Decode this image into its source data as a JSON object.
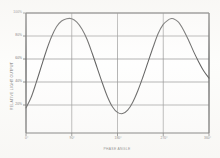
{
  "chart_data": {
    "type": "line",
    "title": "",
    "xlabel": "PHASE ANGLE",
    "ylabel": "RELATIVE LIGHT OUTPUT",
    "xlim": [
      0,
      360
    ],
    "ylim": [
      0,
      105
    ],
    "grid": true,
    "legend": "none",
    "x_tick_labels": [
      "0°",
      "90°",
      "180°",
      "270°",
      "360°"
    ],
    "x_tick_values": [
      0,
      90,
      180,
      270,
      360
    ],
    "y_tick_labels": [
      "20%",
      "40%",
      "60%",
      "80%",
      "100%"
    ],
    "y_tick_values": [
      20,
      40,
      60,
      80,
      100
    ],
    "series": [
      {
        "name": "relative light output",
        "x": [
          0,
          10,
          20,
          30,
          40,
          50,
          60,
          70,
          80,
          90,
          100,
          110,
          120,
          130,
          140,
          150,
          160,
          170,
          180,
          190,
          200,
          210,
          220,
          230,
          240,
          250,
          260,
          270,
          280,
          285,
          290,
          300,
          310,
          320,
          330,
          340,
          350,
          360
        ],
        "values": [
          22,
          31,
          44,
          58,
          72,
          84,
          93,
          98,
          100,
          100,
          97,
          91,
          82,
          70,
          57,
          44,
          32,
          23,
          18,
          17,
          20,
          27,
          37,
          49,
          62,
          75,
          87,
          95,
          99,
          100,
          100,
          97,
          90,
          81,
          71,
          62,
          54,
          48
        ]
      }
    ],
    "colors": {
      "curve": "#2b2b2b",
      "grid": "#6e6e6e",
      "axis": "#3a3a3a",
      "background": "#fdfdfb",
      "text": "#3b3b3b"
    }
  },
  "axes": {
    "x_title": "PHASE ANGLE",
    "y_title": "RELATIVE LIGHT OUTPUT"
  },
  "x_ticks": [
    {
      "label": "0°"
    },
    {
      "label": "90°"
    },
    {
      "label": "180°"
    },
    {
      "label": "270°"
    },
    {
      "label": "360°"
    }
  ],
  "y_ticks": [
    {
      "label": "100%"
    },
    {
      "label": "80%"
    },
    {
      "label": "60%"
    },
    {
      "label": "40%"
    },
    {
      "label": "20%"
    }
  ]
}
